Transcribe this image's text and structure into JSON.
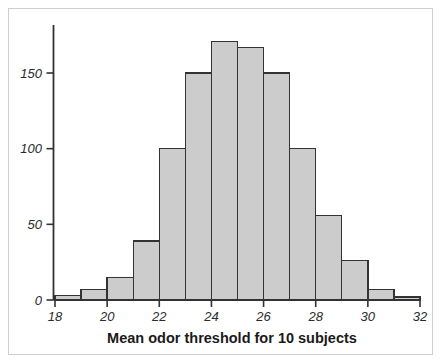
{
  "figure": {
    "background_color": "#ffffff",
    "frame_color": "#c8c8c8"
  },
  "chart_data": {
    "type": "bar",
    "subtype": "histogram",
    "title": "",
    "xlabel": "Mean odor threshold for 10 subjects",
    "ylabel": "",
    "bin_edges": [
      18,
      19,
      20,
      21,
      22,
      23,
      24,
      25,
      26,
      27,
      28,
      29,
      30,
      31,
      32
    ],
    "bin_width": 1,
    "categories": [
      "18-19",
      "19-20",
      "20-21",
      "21-22",
      "22-23",
      "23-24",
      "24-25",
      "25-26",
      "26-27",
      "27-28",
      "28-29",
      "29-30",
      "30-31",
      "31-32"
    ],
    "values": [
      3,
      7,
      15,
      39,
      100,
      150,
      171,
      167,
      150,
      100,
      56,
      26,
      7,
      2
    ],
    "xlim": [
      18,
      32
    ],
    "ylim": [
      0,
      181
    ],
    "xticks": [
      18,
      20,
      22,
      24,
      26,
      28,
      30,
      32
    ],
    "xtick_labels": [
      "18",
      "20",
      "22",
      "24",
      "26",
      "28",
      "30",
      "32"
    ],
    "yticks": [
      0,
      50,
      100,
      150
    ],
    "ytick_labels": [
      "0",
      "50",
      "100",
      "150"
    ],
    "grid": false,
    "legend": null,
    "bar_fill_color": "#cccccc",
    "bar_edge_color": "#333333",
    "axis_color": "#333333"
  }
}
